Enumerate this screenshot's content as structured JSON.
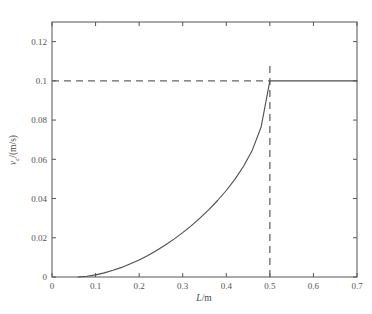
{
  "chart_data": {
    "type": "line",
    "title": "",
    "subtitle": "",
    "xlabel": "L/m",
    "ylabel": "v_c/(m/s)",
    "xlabel_parts": {
      "symbol": "L",
      "unit": "/m"
    },
    "ylabel_parts": {
      "symbol": "v",
      "subscript": "c",
      "unit": "/(m/s)"
    },
    "xlim": [
      0,
      0.7
    ],
    "ylim": [
      0,
      0.13
    ],
    "xticks": [
      0,
      0.1,
      0.2,
      0.3,
      0.4,
      0.5,
      0.6,
      0.7
    ],
    "xtick_labels": [
      "0",
      "0.1",
      "0.2",
      "0.3",
      "0.4",
      "0.5",
      "0.6",
      "0.7"
    ],
    "yticks": [
      0,
      0.02,
      0.04,
      0.06,
      0.08,
      0.1,
      0.12
    ],
    "ytick_labels": [
      "0",
      "0.02",
      "0.04",
      "0.06",
      "0.08",
      "0.1",
      "0.12"
    ],
    "grid": false,
    "legend": null,
    "legend_position": "none",
    "line_color": "#4d4d4d",
    "dash_color": "#666666",
    "axis_color": "#555555",
    "background_color": "#ffffff",
    "series": [
      {
        "name": "critical velocity",
        "style": "solid",
        "x": [
          0.06,
          0.08,
          0.1,
          0.12,
          0.14,
          0.16,
          0.18,
          0.2,
          0.22,
          0.24,
          0.26,
          0.28,
          0.3,
          0.32,
          0.34,
          0.36,
          0.38,
          0.4,
          0.42,
          0.44,
          0.46,
          0.48,
          0.5,
          0.54,
          0.58,
          0.62,
          0.66,
          0.7
        ],
        "y": [
          0.0,
          0.0004,
          0.0011,
          0.0021,
          0.0034,
          0.0049,
          0.0067,
          0.0087,
          0.011,
          0.0135,
          0.0163,
          0.0193,
          0.0226,
          0.0262,
          0.0301,
          0.0343,
          0.039,
          0.0441,
          0.0499,
          0.0566,
          0.0648,
          0.0765,
          0.1,
          0.1,
          0.1,
          0.1,
          0.1,
          0.1
        ]
      }
    ],
    "annotations": [
      {
        "type": "hline",
        "name": "critical-velocity-reference",
        "value": 0.1,
        "style": "dashed",
        "x_from": 0.0,
        "x_to": 0.5
      },
      {
        "type": "vline",
        "name": "critical-length-reference",
        "value": 0.5,
        "style": "dashed",
        "y_from": 0.0,
        "y_to": 0.109
      }
    ],
    "key_points": [
      {
        "label": "knee",
        "x": 0.5,
        "y": 0.1
      }
    ]
  }
}
